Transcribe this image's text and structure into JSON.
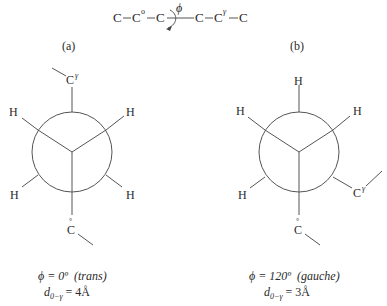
{
  "chain": {
    "atoms": [
      "C",
      "C",
      "C",
      "C",
      "C",
      "C"
    ],
    "c0_label": "C",
    "c0_sup": "o",
    "cg_label": "C",
    "cg_sup": "γ",
    "dash": "—",
    "rotation_symbol": "ϕ"
  },
  "panels": [
    {
      "label": "(a)",
      "front_labels": [
        "H",
        "H"
      ],
      "top_label": "C",
      "top_sup": "γ",
      "back_labels": [
        "H",
        "H"
      ],
      "bottom_label": "C",
      "bottom_mark": "°",
      "caption_phi": "ϕ = 0º",
      "caption_conf": "(trans)",
      "caption_d": "d",
      "caption_d_sub": "0−γ",
      "caption_d_val": " = 4Å"
    },
    {
      "label": "(b)",
      "top_label": "H",
      "front_labels": [
        "H",
        "H"
      ],
      "back_left_label": "H",
      "back_right_label": "C",
      "back_right_sup": "γ",
      "bottom_label": "C",
      "bottom_mark": "°",
      "caption_phi": "ϕ = 120º",
      "caption_conf": "(gauche)",
      "caption_d": "d",
      "caption_d_sub": "0−γ",
      "caption_d_val": " = 3Å"
    }
  ]
}
